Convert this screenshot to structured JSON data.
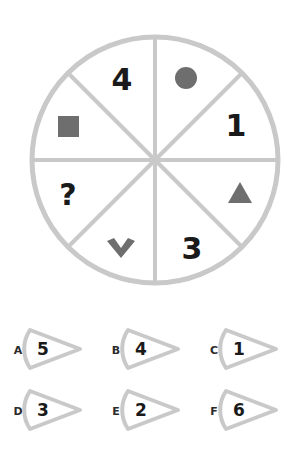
{
  "puzzle": {
    "type": "pie-sector-sequence",
    "wheel": {
      "sector_count": 8,
      "outline_color": "#c9c9c9",
      "glyph_color": "#6e6e6e",
      "text_color": "#1a1a1a",
      "sectors": [
        {
          "position": "top-right",
          "kind": "icon",
          "icon": "filled-circle-icon",
          "label": ""
        },
        {
          "position": "right-upper",
          "kind": "number",
          "icon": "",
          "label": "1"
        },
        {
          "position": "right-lower",
          "kind": "icon",
          "icon": "filled-triangle-icon",
          "label": ""
        },
        {
          "position": "bottom-right",
          "kind": "number",
          "icon": "",
          "label": "3"
        },
        {
          "position": "bottom-left",
          "kind": "icon",
          "icon": "chevron-down-icon",
          "label": ""
        },
        {
          "position": "left-lower",
          "kind": "question",
          "icon": "",
          "label": "?"
        },
        {
          "position": "left-upper",
          "kind": "icon",
          "icon": "filled-square-icon",
          "label": ""
        },
        {
          "position": "top-left",
          "kind": "number",
          "icon": "",
          "label": "4"
        }
      ]
    },
    "options": [
      {
        "letter": "A",
        "value": "5"
      },
      {
        "letter": "B",
        "value": "4"
      },
      {
        "letter": "C",
        "value": "1"
      },
      {
        "letter": "D",
        "value": "3"
      },
      {
        "letter": "E",
        "value": "2"
      },
      {
        "letter": "F",
        "value": "6"
      }
    ]
  },
  "colors": {
    "background": "#ffffff",
    "line": "#c9c9c9",
    "glyph": "#6e6e6e",
    "text": "#1a1a1a",
    "letter": "#2b2b2b"
  }
}
